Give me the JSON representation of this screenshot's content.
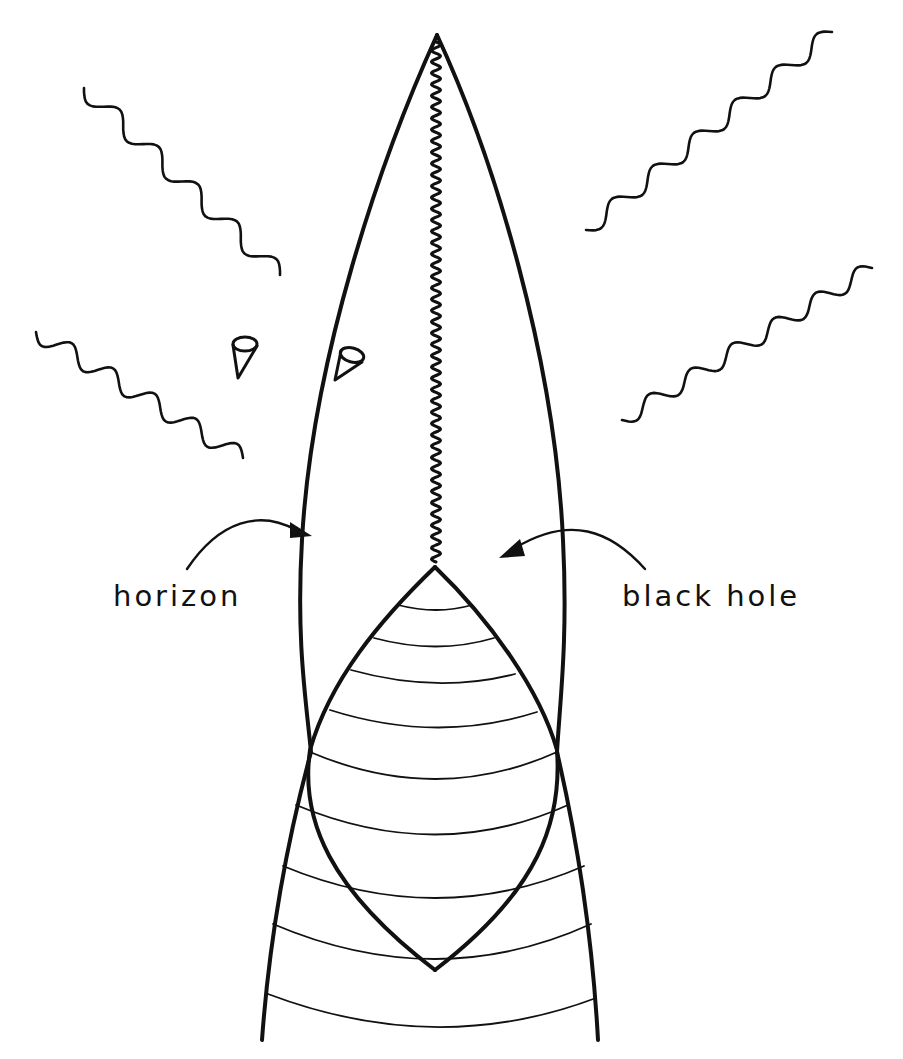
{
  "figure": {
    "labels": {
      "horizon": "horizon",
      "black_hole": "black hole"
    },
    "elements": [
      {
        "name": "event-horizon-outline",
        "description": "spindle-shaped outline meeting at apex"
      },
      {
        "name": "singularity",
        "description": "zigzag vertical line from apex to top of collapsing star"
      },
      {
        "name": "collapsing-star",
        "description": "lens-shaped region with curved time slices"
      },
      {
        "name": "light-cones",
        "count": 2
      },
      {
        "name": "outgoing-radiation",
        "count": 4
      }
    ],
    "colors": {
      "ink": "#111111",
      "background": "#ffffff"
    }
  }
}
